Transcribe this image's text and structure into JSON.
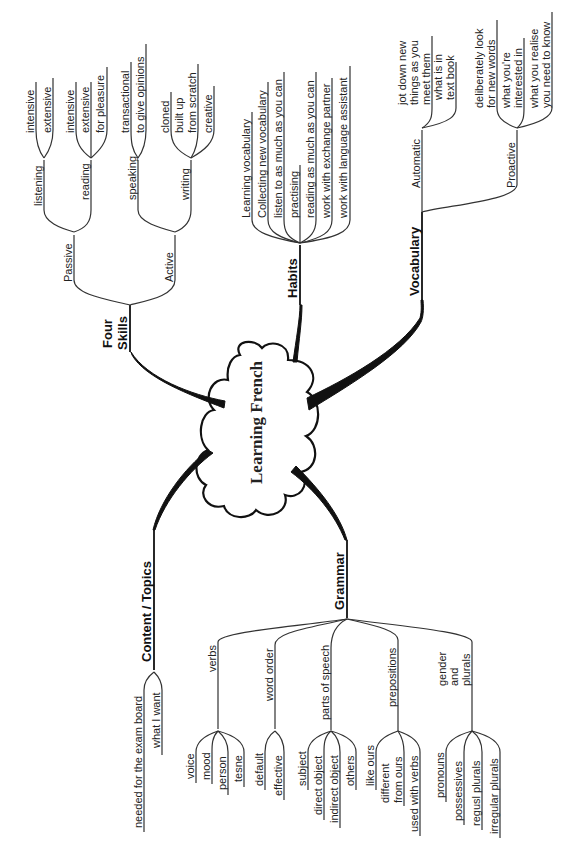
{
  "center": {
    "label": "Learning French"
  },
  "branches": {
    "four_skills": {
      "label_line1": "Four",
      "label_line2": "Skills",
      "passive": {
        "label": "Passive",
        "listening": {
          "label": "listening",
          "items": [
            "intensive",
            "extensive"
          ]
        },
        "reading": {
          "label": "reading",
          "items": [
            "intensive",
            "extensive",
            "for pleasure"
          ]
        }
      },
      "active": {
        "label": "Active",
        "speaking": {
          "label": "speaking",
          "items": [
            "transactional",
            "to give opinions"
          ]
        },
        "writing": {
          "label": "writing",
          "items": [
            "cloned",
            "built up",
            "from scratch",
            "creative"
          ]
        }
      }
    },
    "habits": {
      "label": "Habits",
      "items": [
        "Learning vocabulary",
        "Collecting new vocabulary",
        "listen to as much as you can",
        "practising",
        "reading as much as you can",
        "work with exchange partner",
        "work with language assistant"
      ]
    },
    "vocabulary": {
      "label": "Vocabulary",
      "automatic": {
        "label": "Automatic",
        "items": [
          "jot down new",
          "things as you",
          "meet them",
          "what is in",
          "text book"
        ]
      },
      "proactive": {
        "label": "Proactive",
        "items": [
          "deliberately look",
          "for new words",
          "what you're",
          "interested in",
          "what you realise",
          "you need to know"
        ]
      }
    },
    "content_topics": {
      "label": "Content / Topics",
      "items": [
        "needed for the exam board",
        "what I want"
      ]
    },
    "grammar": {
      "label": "Grammar",
      "verbs": {
        "label": "verbs",
        "items": [
          "voice",
          "mood",
          "person",
          "tesne"
        ]
      },
      "word_order": {
        "label": "word order",
        "items": [
          "default",
          "effective"
        ]
      },
      "parts_of_speech": {
        "label": "parts of speech",
        "items": [
          "subject",
          "direct object",
          "indirect object",
          "others"
        ]
      },
      "prepositions": {
        "label": "prepositions",
        "items": [
          "like ours",
          "different",
          "from ours",
          "used with verbs"
        ]
      },
      "gender_plurals": {
        "label_line1": "gender",
        "label_line2": "and",
        "label_line3": "plurals",
        "items": [
          "pronouns",
          "possessives",
          "regusl plurals",
          "irregular plurals"
        ]
      }
    }
  }
}
